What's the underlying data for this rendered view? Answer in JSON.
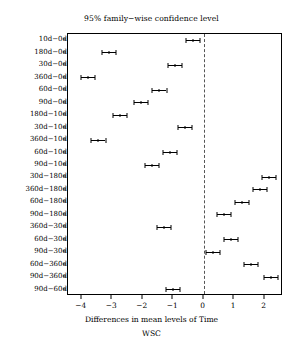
{
  "chart_data": {
    "type": "scatter",
    "title": "95% family−wise confidence level",
    "xlabel": "Differences in mean levels of Time",
    "sublabel": "WSC",
    "ylabel": "",
    "xlim": [
      -4.45,
      2.6
    ],
    "xticks": [
      -4,
      -3,
      -2,
      -1,
      0,
      1,
      2
    ],
    "xticklabels": [
      "−4",
      "−3",
      "−2",
      "−1",
      "0",
      "1",
      "2"
    ],
    "grid": false,
    "reference_line": 0,
    "categories": [
      "10d−0d",
      "180d−0d",
      "30d−0d",
      "360d−0d",
      "60d−0d",
      "90d−0d",
      "180d−10d",
      "30d−10d",
      "360d−10d",
      "60d−10d",
      "90d−10d",
      "30d−180d",
      "360d−180d",
      "60d−180d",
      "90d−180d",
      "360d−30d",
      "60d−30d",
      "90d−30d",
      "60d−360d",
      "90d−360d",
      "90d−60d"
    ],
    "values": [
      -0.35,
      -3.1,
      -0.95,
      -3.8,
      -1.45,
      -2.05,
      -2.75,
      -0.6,
      -3.45,
      -1.1,
      -1.7,
      2.15,
      1.85,
      1.25,
      0.65,
      -1.3,
      0.9,
      0.3,
      1.55,
      2.2,
      -1.0
    ],
    "ci_lower": [
      -0.58,
      -3.33,
      -1.18,
      -4.03,
      -1.68,
      -2.28,
      -2.98,
      -0.83,
      -3.68,
      -1.33,
      -1.93,
      1.92,
      1.62,
      1.02,
      0.42,
      -1.53,
      0.67,
      0.07,
      1.32,
      1.97,
      -1.23
    ],
    "ci_upper": [
      -0.12,
      -2.87,
      -0.72,
      -3.57,
      -1.22,
      -1.82,
      -2.52,
      -0.37,
      -3.22,
      -0.87,
      -1.47,
      2.38,
      2.08,
      1.48,
      0.88,
      -1.07,
      1.13,
      0.53,
      1.78,
      2.43,
      -0.77
    ]
  }
}
